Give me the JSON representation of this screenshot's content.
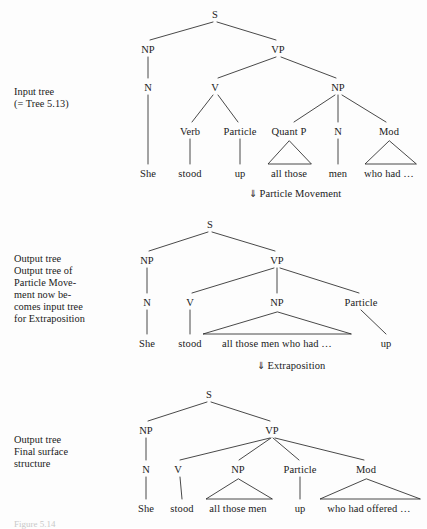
{
  "page": {
    "background_color": "#fdfdfd",
    "ink_color": "#1a1a1a",
    "width": 427,
    "height": 528
  },
  "caption": {
    "text": "Figure 5.14"
  },
  "sections": [
    {
      "id": "input-tree",
      "label": "Input tree\n(= Tree 5.13)",
      "label_pos": {
        "x": 14,
        "y": 86
      },
      "nodes": [
        {
          "name": "S",
          "text": "S",
          "x": 215,
          "y": 9
        },
        {
          "name": "NP",
          "text": "NP",
          "x": 148,
          "y": 44
        },
        {
          "name": "VP",
          "text": "VP",
          "x": 278,
          "y": 44
        },
        {
          "name": "N",
          "text": "N",
          "x": 148,
          "y": 82
        },
        {
          "name": "V",
          "text": "V",
          "x": 215,
          "y": 82
        },
        {
          "name": "NP2",
          "text": "NP",
          "x": 338,
          "y": 82
        },
        {
          "name": "Verb",
          "text": "Verb",
          "x": 190,
          "y": 126
        },
        {
          "name": "Particle",
          "text": "Particle",
          "x": 240,
          "y": 126
        },
        {
          "name": "QuantP",
          "text": "Quant P",
          "x": 289,
          "y": 126
        },
        {
          "name": "N2",
          "text": "N",
          "x": 338,
          "y": 126
        },
        {
          "name": "Mod",
          "text": "Mod",
          "x": 389,
          "y": 126
        }
      ],
      "leaves": [
        {
          "name": "She",
          "text": "She",
          "x": 148,
          "y": 168
        },
        {
          "name": "stood",
          "text": "stood",
          "x": 190,
          "y": 168
        },
        {
          "name": "up",
          "text": "up",
          "x": 240,
          "y": 168
        },
        {
          "name": "all-those",
          "text": "all those",
          "x": 289,
          "y": 168
        },
        {
          "name": "men",
          "text": "men",
          "x": 338,
          "y": 168
        },
        {
          "name": "who-had",
          "text": "who had …",
          "x": 389,
          "y": 168
        }
      ]
    },
    {
      "id": "output-tree-particle-movement",
      "label": "Output tree\nOutput tree of\nParticle Move-\nment now be-\ncomes input tree\nfor Extraposition",
      "label_pos": {
        "x": 14,
        "y": 253
      },
      "nodes": [
        {
          "name": "S",
          "text": "S",
          "x": 210,
          "y": 219
        },
        {
          "name": "NP",
          "text": "NP",
          "x": 147,
          "y": 255
        },
        {
          "name": "VP",
          "text": "VP",
          "x": 277,
          "y": 255
        },
        {
          "name": "N",
          "text": "N",
          "x": 147,
          "y": 297
        },
        {
          "name": "V",
          "text": "V",
          "x": 190,
          "y": 297
        },
        {
          "name": "NP2",
          "text": "NP",
          "x": 277,
          "y": 297
        },
        {
          "name": "Particle",
          "text": "Particle",
          "x": 361,
          "y": 297
        }
      ],
      "leaves": [
        {
          "name": "She",
          "text": "She",
          "x": 147,
          "y": 338
        },
        {
          "name": "stood",
          "text": "stood",
          "x": 190,
          "y": 338
        },
        {
          "name": "NP-span",
          "text": "all those men who had …",
          "x": 277,
          "y": 338
        },
        {
          "name": "up",
          "text": "up",
          "x": 386,
          "y": 338
        }
      ]
    },
    {
      "id": "output-tree-final",
      "label": "Output tree\nFinal surface\nstructure",
      "label_pos": {
        "x": 14,
        "y": 434
      },
      "nodes": [
        {
          "name": "S",
          "text": "S",
          "x": 209,
          "y": 389
        },
        {
          "name": "NP",
          "text": "NP",
          "x": 146,
          "y": 425
        },
        {
          "name": "VP",
          "text": "VP",
          "x": 272,
          "y": 425
        },
        {
          "name": "N",
          "text": "N",
          "x": 146,
          "y": 464
        },
        {
          "name": "V",
          "text": "V",
          "x": 178,
          "y": 464
        },
        {
          "name": "NP2",
          "text": "NP",
          "x": 238,
          "y": 464
        },
        {
          "name": "Particle",
          "text": "Particle",
          "x": 300,
          "y": 464
        },
        {
          "name": "Mod",
          "text": "Mod",
          "x": 366,
          "y": 464
        }
      ],
      "leaves": [
        {
          "name": "She",
          "text": "She",
          "x": 146,
          "y": 503
        },
        {
          "name": "stood",
          "text": "stood",
          "x": 182,
          "y": 503
        },
        {
          "name": "all-those-men",
          "text": "all those men",
          "x": 238,
          "y": 503
        },
        {
          "name": "up",
          "text": "up",
          "x": 300,
          "y": 503
        },
        {
          "name": "who-had-offered",
          "text": "who had offered …",
          "x": 369,
          "y": 503
        }
      ]
    }
  ],
  "annotations": [
    {
      "id": "particle-movement",
      "arrow": "⇓",
      "text": "Particle Movement",
      "x": 249,
      "y": 188
    },
    {
      "id": "extraposition",
      "arrow": "⇓",
      "text": "Extraposition",
      "x": 257,
      "y": 360
    }
  ]
}
